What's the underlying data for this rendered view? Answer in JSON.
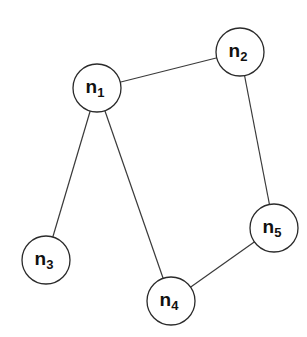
{
  "diagram": {
    "type": "undirected-graph",
    "node_radius": 24,
    "colors": {
      "background": "#ffffff",
      "stroke": "#2a2a2a",
      "edge": "#3a3a3a",
      "text": "#111111"
    },
    "nodes": [
      {
        "id": "n1",
        "base": "n",
        "sub": "1",
        "x": 97,
        "y": 88
      },
      {
        "id": "n2",
        "base": "n",
        "sub": "2",
        "x": 240,
        "y": 52
      },
      {
        "id": "n3",
        "base": "n",
        "sub": "3",
        "x": 46,
        "y": 260
      },
      {
        "id": "n4",
        "base": "n",
        "sub": "4",
        "x": 171,
        "y": 301
      },
      {
        "id": "n5",
        "base": "n",
        "sub": "5",
        "x": 274,
        "y": 228
      }
    ],
    "edges": [
      {
        "from": "n1",
        "to": "n2"
      },
      {
        "from": "n1",
        "to": "n3"
      },
      {
        "from": "n1",
        "to": "n4"
      },
      {
        "from": "n2",
        "to": "n5"
      },
      {
        "from": "n4",
        "to": "n5"
      }
    ]
  }
}
